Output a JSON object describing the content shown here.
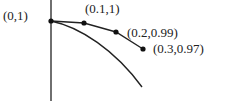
{
  "diagram": {
    "type": "euler-method-approximation",
    "points": [
      {
        "label": "(0,1)",
        "x": 0,
        "y": 1
      },
      {
        "label": "(0.1,1)",
        "x": 0.1,
        "y": 1
      },
      {
        "label": "(0.2,0.99)",
        "x": 0.2,
        "y": 0.99
      },
      {
        "label": "(0.3,0.97)",
        "x": 0.3,
        "y": 0.97
      }
    ],
    "colors": {
      "stroke": "#222222",
      "background": "#ffffff"
    }
  }
}
